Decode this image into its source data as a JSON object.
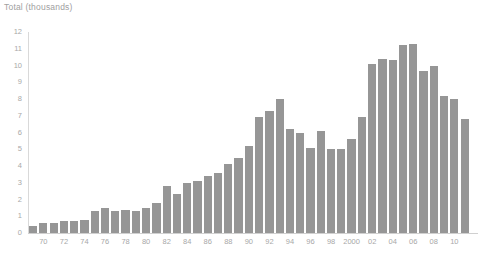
{
  "chart_data": {
    "type": "bar",
    "title": "Total (thousands)",
    "xlabel": "",
    "ylabel": "Total (thousands)",
    "ylim": [
      0,
      12
    ],
    "y_ticks": [
      0,
      1,
      2,
      3,
      4,
      5,
      6,
      7,
      8,
      9,
      10,
      11,
      12
    ],
    "y_tick_labels": [
      "0",
      "1",
      "2",
      "3",
      "4",
      "5",
      "6",
      "7",
      "8",
      "9",
      "10",
      "11",
      "12"
    ],
    "grid": false,
    "legend": null,
    "bar_color": "#969696",
    "axis_color": "#d9d9d9",
    "text_color": "#a8a8a8",
    "categories": [
      "1969",
      "1970",
      "1971",
      "1972",
      "1973",
      "1974",
      "1975",
      "1976",
      "1977",
      "1978",
      "1979",
      "1980",
      "1981",
      "1982",
      "1983",
      "1984",
      "1985",
      "1986",
      "1987",
      "1988",
      "1989",
      "1990",
      "1991",
      "1992",
      "1993",
      "1994",
      "1995",
      "1996",
      "1997",
      "1998",
      "1999",
      "2000",
      "2001",
      "2002",
      "2003",
      "2004",
      "2005",
      "2006",
      "2007",
      "2008",
      "2009",
      "2010",
      "2011"
    ],
    "values": [
      0.4,
      0.6,
      0.6,
      0.7,
      0.7,
      0.8,
      1.3,
      1.5,
      1.3,
      1.4,
      1.3,
      1.5,
      1.8,
      2.8,
      2.3,
      3.0,
      3.1,
      3.4,
      3.6,
      4.1,
      4.5,
      5.2,
      6.9,
      7.3,
      8.0,
      6.2,
      6.0,
      5.1,
      6.1,
      5.0,
      5.0,
      5.6,
      6.9,
      10.1,
      10.4,
      10.3,
      11.2,
      11.3,
      9.7,
      10.0,
      8.2,
      8.0,
      6.8
    ],
    "x_tick_labels": [
      {
        "label": "70",
        "year": 1970
      },
      {
        "label": "72",
        "year": 1972
      },
      {
        "label": "74",
        "year": 1974
      },
      {
        "label": "76",
        "year": 1976
      },
      {
        "label": "78",
        "year": 1978
      },
      {
        "label": "80",
        "year": 1980
      },
      {
        "label": "82",
        "year": 1982
      },
      {
        "label": "84",
        "year": 1984
      },
      {
        "label": "86",
        "year": 1986
      },
      {
        "label": "88",
        "year": 1988
      },
      {
        "label": "90",
        "year": 1990
      },
      {
        "label": "92",
        "year": 1992
      },
      {
        "label": "94",
        "year": 1994
      },
      {
        "label": "96",
        "year": 1996
      },
      {
        "label": "98",
        "year": 1998
      },
      {
        "label": "2000",
        "year": 2000
      },
      {
        "label": "02",
        "year": 2002
      },
      {
        "label": "04",
        "year": 2004
      },
      {
        "label": "06",
        "year": 2006
      },
      {
        "label": "08",
        "year": 2008
      },
      {
        "label": "10",
        "year": 2010
      }
    ]
  }
}
